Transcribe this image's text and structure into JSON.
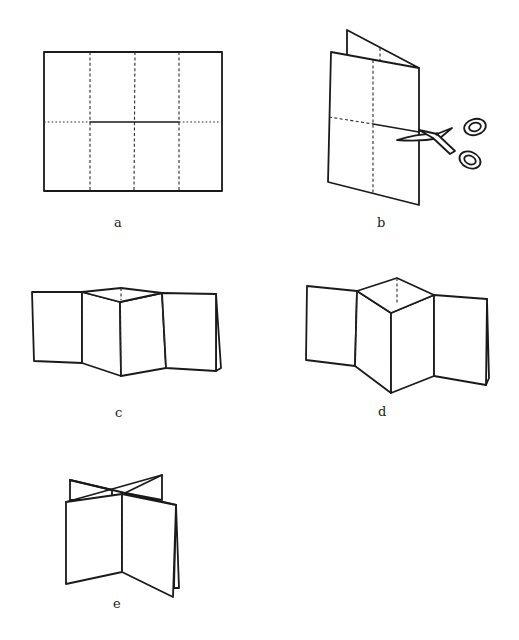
{
  "figure": {
    "panels": [
      {
        "id": "a",
        "label": "a",
        "description": "Flat sheet with 8 panels: 3 vertical dashed fold lines, horizontal dotted fold with solid center cut"
      },
      {
        "id": "b",
        "label": "b",
        "description": "Sheet folded in half, scissors cutting along the center line"
      },
      {
        "id": "c",
        "label": "c",
        "description": "Folded zig-zag book with small diamond opening"
      },
      {
        "id": "d",
        "label": "d",
        "description": "Zig-zag book pushed further with larger diamond opening"
      },
      {
        "id": "e",
        "label": "e",
        "description": "Fully folded star/cross book standing upright"
      }
    ]
  },
  "colors": {
    "line": "#1a1a1a",
    "background": "#ffffff"
  }
}
